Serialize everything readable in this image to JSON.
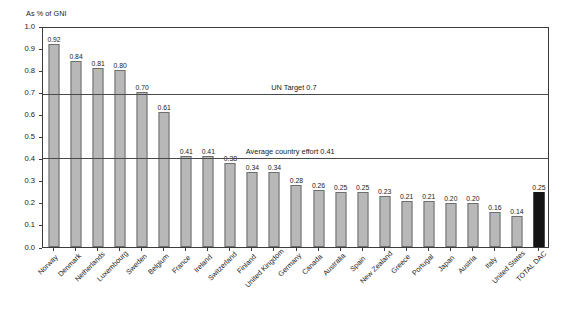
{
  "chart_data": {
    "type": "bar",
    "title": "",
    "subtitle": "",
    "ylabel": "As % of GNI",
    "xlabel": "",
    "ylim": [
      0.0,
      1.0
    ],
    "ytick_labels": [
      "0.0",
      "0.1",
      "0.2",
      "0.3",
      "0.4",
      "0.5",
      "0.6",
      "0.7",
      "0.8",
      "0.9",
      "1.0"
    ],
    "ytick_values": [
      0.0,
      0.1,
      0.2,
      0.3,
      0.4,
      0.5,
      0.6,
      0.7,
      0.8,
      0.9,
      1.0
    ],
    "grid": false,
    "legend": "none",
    "categories": [
      "Norway",
      "Denmark",
      "Netherlands",
      "Luxembourg",
      "Sweden",
      "Belgium",
      "France",
      "Ireland",
      "Switzerland",
      "Finland",
      "United Kingdom",
      "Germany",
      "Canada",
      "Australia",
      "Spain",
      "New Zealand",
      "Greece",
      "Portugal",
      "Japan",
      "Austria",
      "Italy",
      "United States",
      "TOTAL DAC"
    ],
    "values": [
      0.92,
      0.84,
      0.81,
      0.8,
      0.7,
      0.61,
      0.41,
      0.41,
      0.38,
      0.34,
      0.34,
      0.28,
      0.26,
      0.25,
      0.25,
      0.23,
      0.21,
      0.21,
      0.2,
      0.2,
      0.16,
      0.14,
      0.25
    ],
    "value_labels": [
      "0.92",
      "0.84",
      "0.81",
      "0.80",
      "0.70",
      "0.61",
      "0.41",
      "0.41",
      "0.38",
      "0.34",
      "0.34",
      "0.28",
      "0.26",
      "0.25",
      "0.25",
      "0.23",
      "0.21",
      "0.21",
      "0.20",
      "0.20",
      "0.16",
      "0.14",
      "0.25"
    ],
    "highlight_index": 22,
    "bar_color": "#b8b8b8",
    "bar_edge_color": "#6e6e6e",
    "highlight_color": "#141414",
    "annotations": [
      {
        "label": "UN Target 0.7",
        "value": 0.7,
        "label_x_frac": 0.45
      },
      {
        "label": "Average country effort 0.41",
        "value": 0.41,
        "label_x_frac": 0.4
      }
    ]
  }
}
